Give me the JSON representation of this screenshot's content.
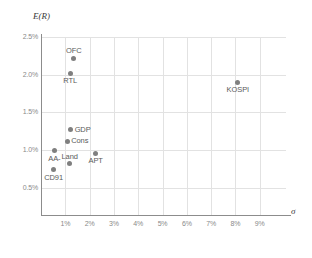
{
  "chart_data": {
    "type": "scatter",
    "title": "",
    "xlabel": "σ",
    "ylabel": "E(R)",
    "xlim": [
      0,
      9.5
    ],
    "ylim": [
      0,
      2.6
    ],
    "grid": true,
    "legend": "none",
    "x_ticks": [
      "1%",
      "2%",
      "3%",
      "4%",
      "5%",
      "6%",
      "7%",
      "8%",
      "9%"
    ],
    "x_tick_values": [
      1,
      2,
      3,
      4,
      5,
      6,
      7,
      8,
      9
    ],
    "y_ticks": [
      "0.5%",
      "1.0%",
      "1.5%",
      "2.0%",
      "2.5%"
    ],
    "y_tick_values": [
      0.5,
      1.0,
      1.5,
      2.0,
      2.5
    ],
    "point_color": "#7f7f7f",
    "grid_color": "#e2e2e2",
    "axis_color": "#8c8c8c",
    "points": [
      {
        "label": "OFC",
        "x": 1.35,
        "y": 2.22,
        "label_pos": "above"
      },
      {
        "label": "RTL",
        "x": 1.2,
        "y": 2.02,
        "label_pos": "below"
      },
      {
        "label": "KOSPI",
        "x": 8.1,
        "y": 1.9,
        "label_pos": "below"
      },
      {
        "label": "GDP",
        "x": 1.22,
        "y": 1.27,
        "label_pos": "right"
      },
      {
        "label": "Cons",
        "x": 1.08,
        "y": 1.12,
        "label_pos": "right"
      },
      {
        "label": "AA-",
        "x": 0.55,
        "y": 0.99,
        "label_pos": "below"
      },
      {
        "label": "APT",
        "x": 2.25,
        "y": 0.96,
        "label_pos": "below"
      },
      {
        "label": "Land",
        "x": 1.18,
        "y": 0.82,
        "label_pos": "above"
      },
      {
        "label": "CD91",
        "x": 0.52,
        "y": 0.74,
        "label_pos": "below"
      }
    ]
  }
}
